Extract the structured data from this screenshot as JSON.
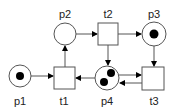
{
  "diagram": {
    "type": "petri-net",
    "places": [
      {
        "id": "p1",
        "label": "p1",
        "tokens": 1
      },
      {
        "id": "p2",
        "label": "p2",
        "tokens": 0
      },
      {
        "id": "p3",
        "label": "p3",
        "tokens": 1
      },
      {
        "id": "p4",
        "label": "p4",
        "tokens": 2
      }
    ],
    "transitions": [
      {
        "id": "t1",
        "label": "t1"
      },
      {
        "id": "t2",
        "label": "t2"
      },
      {
        "id": "t3",
        "label": "t3"
      }
    ],
    "arcs": [
      {
        "from": "p1",
        "to": "t1"
      },
      {
        "from": "t1",
        "to": "p2"
      },
      {
        "from": "p2",
        "to": "t2"
      },
      {
        "from": "t2",
        "to": "p3"
      },
      {
        "from": "t2",
        "to": "p4"
      },
      {
        "from": "p4",
        "to": "t1"
      },
      {
        "from": "p3",
        "to": "t3"
      },
      {
        "from": "p4",
        "to": "t3"
      },
      {
        "from": "t3",
        "to": "p4"
      }
    ],
    "colors": {
      "stroke": "#444444",
      "token": "#000000",
      "background": "#ffffff"
    }
  }
}
